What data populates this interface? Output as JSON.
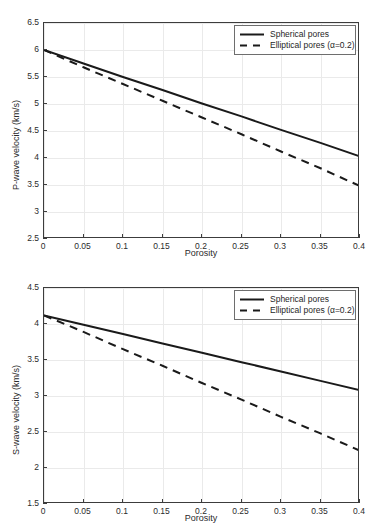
{
  "figure": {
    "background": "#ffffff",
    "line_color": "#1a1a1a",
    "axis_color": "#3c3c3c",
    "grid_color": "#eaeaea"
  },
  "panels": [
    {
      "id": "p-wave",
      "legend": {
        "entries": [
          {
            "label": "Spherical pores",
            "style": "solid"
          },
          {
            "label": "Elliptical pores (α=0.2)",
            "style": "dashed"
          }
        ]
      }
    },
    {
      "id": "s-wave",
      "legend": {
        "entries": [
          {
            "label": "Spherical pores",
            "style": "solid"
          },
          {
            "label": "Elliptical pores (α=0.2)",
            "style": "dashed"
          }
        ]
      }
    }
  ],
  "chart_data": [
    {
      "type": "line",
      "title": "",
      "xlabel": "Porosity",
      "ylabel": "P-wave velocity (km/s)",
      "xlim": [
        0,
        0.4
      ],
      "ylim": [
        2.5,
        6.5
      ],
      "xticks": [
        0,
        0.05,
        0.1,
        0.15,
        0.2,
        0.25,
        0.3,
        0.35,
        0.4
      ],
      "xticklabels": [
        "0",
        "0.05",
        "0.1",
        "0.15",
        "0.2",
        "0.25",
        "0.3",
        "0.35",
        "0.4"
      ],
      "yticks": [
        2.5,
        3,
        3.5,
        4,
        4.5,
        5,
        5.5,
        6,
        6.5
      ],
      "yticklabels": [
        "2.5",
        "3",
        "3.5",
        "4",
        "4.5",
        "5",
        "5.5",
        "6",
        "6.5"
      ],
      "grid": true,
      "legend_position": "top-right",
      "x": [
        0,
        0.05,
        0.1,
        0.15,
        0.2,
        0.25,
        0.3,
        0.35,
        0.4
      ],
      "series": [
        {
          "name": "Spherical pores",
          "style": "solid",
          "values": [
            6.0,
            5.75,
            5.5,
            5.26,
            5.01,
            4.77,
            4.52,
            4.28,
            4.03
          ]
        },
        {
          "name": "Elliptical pores (α=0.2)",
          "style": "dashed",
          "values": [
            6.0,
            5.68,
            5.37,
            5.06,
            4.75,
            4.44,
            4.12,
            3.81,
            3.48
          ]
        }
      ]
    },
    {
      "type": "line",
      "title": "",
      "xlabel": "Porosity",
      "ylabel": "S-wave velocity (km/s)",
      "xlim": [
        0,
        0.4
      ],
      "ylim": [
        1.5,
        4.5
      ],
      "xticks": [
        0,
        0.05,
        0.1,
        0.15,
        0.2,
        0.25,
        0.3,
        0.35,
        0.4
      ],
      "xticklabels": [
        "0",
        "0.05",
        "0.1",
        "0.15",
        "0.2",
        "0.25",
        "0.3",
        "0.35",
        "0.4"
      ],
      "yticks": [
        1.5,
        2,
        2.5,
        3,
        3.5,
        4,
        4.5
      ],
      "yticklabels": [
        "1.5",
        "2",
        "2.5",
        "3",
        "3.5",
        "4",
        "4.5"
      ],
      "grid": true,
      "legend_position": "top-right",
      "x": [
        0,
        0.05,
        0.1,
        0.15,
        0.2,
        0.25,
        0.3,
        0.35,
        0.4
      ],
      "series": [
        {
          "name": "Spherical pores",
          "style": "solid",
          "values": [
            4.12,
            3.99,
            3.86,
            3.73,
            3.6,
            3.47,
            3.34,
            3.21,
            3.08
          ]
        },
        {
          "name": "Elliptical pores (α=0.2)",
          "style": "dashed",
          "values": [
            4.12,
            3.89,
            3.65,
            3.42,
            3.18,
            2.95,
            2.71,
            2.48,
            2.24
          ]
        }
      ]
    }
  ]
}
